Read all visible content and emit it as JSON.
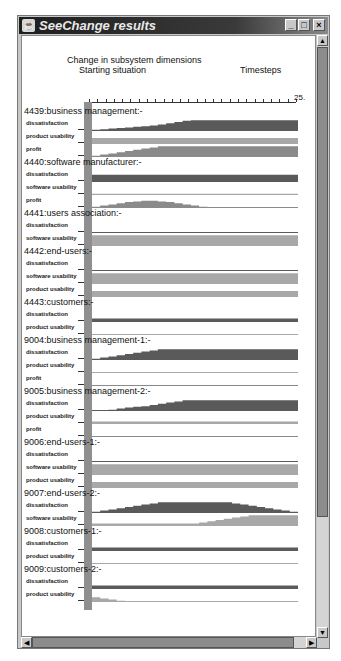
{
  "window": {
    "title": "SeeChange results",
    "icon": "java-cup-icon",
    "controls": {
      "minimize": "_",
      "maximize": "□",
      "close": "×"
    }
  },
  "chart": {
    "heading": "Change in subsystem dimensions",
    "start_label": "Starting situation",
    "timesteps_label": "Timesteps",
    "max_timestep": "25.",
    "colors": {
      "dark": "#5a5a5a",
      "medium": "#8a8a8a",
      "light": "#a8a8a8"
    }
  },
  "chart_data": {
    "type": "area",
    "title": "Change in subsystem dimensions",
    "xlabel": "Timesteps",
    "xlim": [
      0,
      25
    ],
    "groups": [
      {
        "name": "4439:business management:-",
        "series": [
          {
            "name": "dissatisfaction",
            "shape": "ramp-up",
            "values": [
              0.1,
              0.15,
              0.2,
              0.25,
              0.3,
              0.35,
              0.4,
              0.45,
              0.55,
              0.65,
              0.75,
              0.85,
              0.9,
              0.9,
              0.9,
              0.9,
              0.9,
              0.9,
              0.9,
              0.9,
              0.9,
              0.9,
              0.9,
              0.9,
              0.9
            ]
          },
          {
            "name": "product usability",
            "shape": "flat",
            "values": [
              0.5,
              0.5,
              0.5,
              0.5,
              0.5,
              0.5,
              0.5,
              0.5,
              0.5,
              0.5,
              0.5,
              0.5,
              0.5,
              0.5,
              0.5,
              0.5,
              0.5,
              0.5,
              0.5,
              0.5,
              0.5,
              0.5,
              0.5,
              0.5,
              0.5
            ]
          },
          {
            "name": "profit",
            "shape": "ramp-up",
            "values": [
              0.1,
              0.2,
              0.3,
              0.4,
              0.5,
              0.6,
              0.7,
              0.8,
              0.9,
              0.9,
              0.9,
              0.9,
              0.9,
              0.9,
              0.9,
              0.9,
              0.9,
              0.9,
              0.9,
              0.9,
              0.9,
              0.9,
              0.9,
              0.9,
              0.9
            ]
          }
        ]
      },
      {
        "name": "4440:software manufacturer:-",
        "series": [
          {
            "name": "dissatisfaction",
            "shape": "flat",
            "values": [
              0.6,
              0.6,
              0.6,
              0.6,
              0.6,
              0.6,
              0.6,
              0.6,
              0.6,
              0.6,
              0.6,
              0.6,
              0.6,
              0.6,
              0.6,
              0.6,
              0.6,
              0.6,
              0.6,
              0.6,
              0.6,
              0.6,
              0.6,
              0.6,
              0.6
            ]
          },
          {
            "name": "software usability",
            "shape": "flat",
            "values": [
              0.1,
              0.1,
              0.1,
              0.1,
              0.1,
              0.1,
              0.1,
              0.1,
              0.1,
              0.1,
              0.1,
              0.1,
              0.1,
              0.1,
              0.1,
              0.1,
              0.1,
              0.1,
              0.1,
              0.1,
              0.1,
              0.1,
              0.1,
              0.1,
              0.1
            ]
          },
          {
            "name": "profit",
            "shape": "hump",
            "values": [
              0.1,
              0.2,
              0.3,
              0.4,
              0.5,
              0.55,
              0.6,
              0.6,
              0.55,
              0.5,
              0.4,
              0.3,
              0.2,
              0.1,
              0.05,
              0.05,
              0.05,
              0.05,
              0.05,
              0.05,
              0.05,
              0.05,
              0.05,
              0.05,
              0.05
            ]
          }
        ]
      },
      {
        "name": "4441:users association:-",
        "series": [
          {
            "name": "dissatisfaction",
            "shape": "flat",
            "values": [
              0.05,
              0.05,
              0.05,
              0.05,
              0.05,
              0.05,
              0.05,
              0.05,
              0.05,
              0.05,
              0.05,
              0.05,
              0.05,
              0.05,
              0.05,
              0.05,
              0.05,
              0.05,
              0.05,
              0.05,
              0.05,
              0.05,
              0.05,
              0.05,
              0.05
            ]
          },
          {
            "name": "software usability",
            "shape": "flat",
            "values": [
              0.9,
              0.9,
              0.9,
              0.9,
              0.9,
              0.9,
              0.9,
              0.9,
              0.9,
              0.9,
              0.9,
              0.9,
              0.9,
              0.9,
              0.9,
              0.9,
              0.9,
              0.9,
              0.9,
              0.9,
              0.9,
              0.9,
              0.9,
              0.9,
              0.9
            ]
          }
        ]
      },
      {
        "name": "4442:end-users:-",
        "series": [
          {
            "name": "dissatisfaction",
            "shape": "flat",
            "values": [
              0.05,
              0.05,
              0.05,
              0.05,
              0.05,
              0.05,
              0.05,
              0.05,
              0.05,
              0.05,
              0.05,
              0.05,
              0.05,
              0.05,
              0.05,
              0.05,
              0.05,
              0.05,
              0.05,
              0.05,
              0.05,
              0.05,
              0.05,
              0.05,
              0.05
            ]
          },
          {
            "name": "software usability",
            "shape": "flat",
            "values": [
              0.9,
              0.9,
              0.9,
              0.9,
              0.9,
              0.9,
              0.9,
              0.9,
              0.9,
              0.9,
              0.9,
              0.9,
              0.9,
              0.9,
              0.9,
              0.9,
              0.9,
              0.9,
              0.9,
              0.9,
              0.9,
              0.9,
              0.9,
              0.9,
              0.9
            ]
          },
          {
            "name": "product usability",
            "shape": "flat",
            "values": [
              0.5,
              0.5,
              0.5,
              0.5,
              0.5,
              0.5,
              0.5,
              0.5,
              0.5,
              0.5,
              0.5,
              0.5,
              0.5,
              0.5,
              0.5,
              0.5,
              0.5,
              0.5,
              0.5,
              0.5,
              0.5,
              0.5,
              0.5,
              0.5,
              0.5
            ]
          }
        ]
      },
      {
        "name": "4443:customers:-",
        "series": [
          {
            "name": "dissatisfaction",
            "shape": "flat",
            "values": [
              0.3,
              0.3,
              0.3,
              0.3,
              0.3,
              0.3,
              0.3,
              0.3,
              0.3,
              0.3,
              0.3,
              0.3,
              0.3,
              0.3,
              0.3,
              0.3,
              0.3,
              0.3,
              0.3,
              0.3,
              0.3,
              0.3,
              0.3,
              0.3,
              0.3
            ]
          },
          {
            "name": "product usability",
            "shape": "flat",
            "values": [
              0.05,
              0.05,
              0.05,
              0.05,
              0.05,
              0.05,
              0.05,
              0.05,
              0.05,
              0.05,
              0.05,
              0.05,
              0.05,
              0.05,
              0.05,
              0.05,
              0.05,
              0.05,
              0.05,
              0.05,
              0.05,
              0.05,
              0.05,
              0.05,
              0.05
            ]
          }
        ]
      },
      {
        "name": "9004:business management-1:-",
        "series": [
          {
            "name": "dissatisfaction",
            "shape": "ramp-up",
            "values": [
              0.1,
              0.2,
              0.3,
              0.4,
              0.5,
              0.6,
              0.7,
              0.8,
              0.9,
              0.9,
              0.9,
              0.9,
              0.9,
              0.9,
              0.9,
              0.9,
              0.9,
              0.9,
              0.9,
              0.9,
              0.9,
              0.9,
              0.9,
              0.9,
              0.9
            ]
          },
          {
            "name": "product usability",
            "shape": "flat",
            "values": [
              0.05,
              0.05,
              0.05,
              0.05,
              0.05,
              0.05,
              0.05,
              0.05,
              0.05,
              0.05,
              0.05,
              0.05,
              0.05,
              0.05,
              0.05,
              0.05,
              0.05,
              0.05,
              0.05,
              0.05,
              0.05,
              0.05,
              0.05,
              0.05,
              0.05
            ]
          },
          {
            "name": "profit",
            "shape": "flat",
            "values": [
              0.05,
              0.05,
              0.05,
              0.05,
              0.05,
              0.05,
              0.05,
              0.05,
              0.05,
              0.05,
              0.05,
              0.05,
              0.05,
              0.05,
              0.05,
              0.05,
              0.05,
              0.05,
              0.05,
              0.05,
              0.05,
              0.05,
              0.05,
              0.05,
              0.05
            ]
          }
        ]
      },
      {
        "name": "9005:business management-2:-",
        "series": [
          {
            "name": "dissatisfaction",
            "shape": "ramp-up",
            "values": [
              0.0,
              0.0,
              0.1,
              0.2,
              0.3,
              0.35,
              0.4,
              0.5,
              0.6,
              0.7,
              0.8,
              0.9,
              0.9,
              0.9,
              0.9,
              0.9,
              0.9,
              0.9,
              0.9,
              0.9,
              0.9,
              0.9,
              0.9,
              0.9,
              0.9
            ]
          },
          {
            "name": "product usability",
            "shape": "flat",
            "values": [
              0.2,
              0.2,
              0.2,
              0.2,
              0.2,
              0.2,
              0.2,
              0.2,
              0.2,
              0.2,
              0.2,
              0.2,
              0.2,
              0.2,
              0.2,
              0.2,
              0.2,
              0.2,
              0.2,
              0.2,
              0.2,
              0.2,
              0.2,
              0.2,
              0.2
            ]
          },
          {
            "name": "profit",
            "shape": "flat",
            "values": [
              0.05,
              0.05,
              0.05,
              0.05,
              0.05,
              0.05,
              0.05,
              0.05,
              0.05,
              0.05,
              0.05,
              0.05,
              0.05,
              0.05,
              0.05,
              0.05,
              0.05,
              0.05,
              0.05,
              0.05,
              0.05,
              0.05,
              0.05,
              0.05,
              0.05
            ]
          }
        ]
      },
      {
        "name": "9006:end-users-1:-",
        "series": [
          {
            "name": "dissatisfaction",
            "shape": "flat",
            "values": [
              0.05,
              0.05,
              0.05,
              0.05,
              0.05,
              0.05,
              0.05,
              0.05,
              0.05,
              0.05,
              0.05,
              0.05,
              0.05,
              0.05,
              0.05,
              0.05,
              0.05,
              0.05,
              0.05,
              0.05,
              0.05,
              0.05,
              0.05,
              0.05,
              0.05
            ]
          },
          {
            "name": "software usability",
            "shape": "flat",
            "values": [
              0.9,
              0.9,
              0.9,
              0.9,
              0.9,
              0.9,
              0.9,
              0.9,
              0.9,
              0.9,
              0.9,
              0.9,
              0.9,
              0.9,
              0.9,
              0.9,
              0.9,
              0.9,
              0.9,
              0.9,
              0.9,
              0.9,
              0.9,
              0.9,
              0.9
            ]
          },
          {
            "name": "product usability",
            "shape": "flat",
            "values": [
              0.5,
              0.5,
              0.5,
              0.5,
              0.5,
              0.5,
              0.5,
              0.5,
              0.5,
              0.5,
              0.5,
              0.5,
              0.5,
              0.5,
              0.5,
              0.5,
              0.5,
              0.5,
              0.5,
              0.5,
              0.5,
              0.5,
              0.5,
              0.5,
              0.5
            ]
          }
        ]
      },
      {
        "name": "9007:end-users-2:-",
        "series": [
          {
            "name": "dissatisfaction",
            "shape": "hump",
            "values": [
              0.1,
              0.2,
              0.3,
              0.4,
              0.5,
              0.6,
              0.7,
              0.8,
              0.9,
              0.9,
              0.9,
              0.9,
              0.9,
              0.9,
              0.9,
              0.9,
              0.9,
              0.8,
              0.7,
              0.6,
              0.5,
              0.4,
              0.3,
              0.2,
              0.1
            ]
          },
          {
            "name": "software usability",
            "shape": "ramp-up",
            "values": [
              0.2,
              0.2,
              0.2,
              0.2,
              0.2,
              0.2,
              0.2,
              0.2,
              0.2,
              0.2,
              0.2,
              0.2,
              0.2,
              0.3,
              0.4,
              0.5,
              0.6,
              0.7,
              0.8,
              0.9,
              0.9,
              0.9,
              0.9,
              0.9,
              0.9
            ]
          }
        ]
      },
      {
        "name": "9008:customers-1:-",
        "series": [
          {
            "name": "dissatisfaction",
            "shape": "flat",
            "values": [
              0.3,
              0.3,
              0.3,
              0.3,
              0.3,
              0.3,
              0.3,
              0.3,
              0.3,
              0.3,
              0.3,
              0.3,
              0.3,
              0.3,
              0.3,
              0.3,
              0.3,
              0.3,
              0.3,
              0.3,
              0.3,
              0.3,
              0.3,
              0.3,
              0.3
            ]
          },
          {
            "name": "product usability",
            "shape": "flat",
            "values": [
              0.05,
              0.05,
              0.05,
              0.05,
              0.05,
              0.05,
              0.05,
              0.05,
              0.05,
              0.05,
              0.05,
              0.05,
              0.05,
              0.05,
              0.05,
              0.05,
              0.05,
              0.05,
              0.05,
              0.05,
              0.05,
              0.05,
              0.05,
              0.05,
              0.05
            ]
          }
        ]
      },
      {
        "name": "9009:customers-2:-",
        "series": [
          {
            "name": "dissatisfaction",
            "shape": "flat",
            "values": [
              0.3,
              0.3,
              0.3,
              0.3,
              0.3,
              0.3,
              0.3,
              0.3,
              0.3,
              0.3,
              0.3,
              0.3,
              0.3,
              0.3,
              0.3,
              0.3,
              0.3,
              0.3,
              0.3,
              0.3,
              0.3,
              0.3,
              0.3,
              0.3,
              0.3
            ]
          },
          {
            "name": "product usability",
            "shape": "ramp-down",
            "values": [
              0.4,
              0.3,
              0.2,
              0.1,
              0.05,
              0.05,
              0.05,
              0.05,
              0.05,
              0.05,
              0.05,
              0.05,
              0.05,
              0.05,
              0.05,
              0.05,
              0.05,
              0.05,
              0.05,
              0.05,
              0.05,
              0.05,
              0.05,
              0.05,
              0.05
            ]
          }
        ]
      }
    ]
  }
}
